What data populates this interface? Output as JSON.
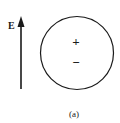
{
  "diagram": {
    "field_label": "E",
    "charges": {
      "positive": "+",
      "negative": "−"
    },
    "caption": "(a)",
    "colors": {
      "stroke": "#1a1a1a",
      "background": "#ffffff"
    }
  }
}
